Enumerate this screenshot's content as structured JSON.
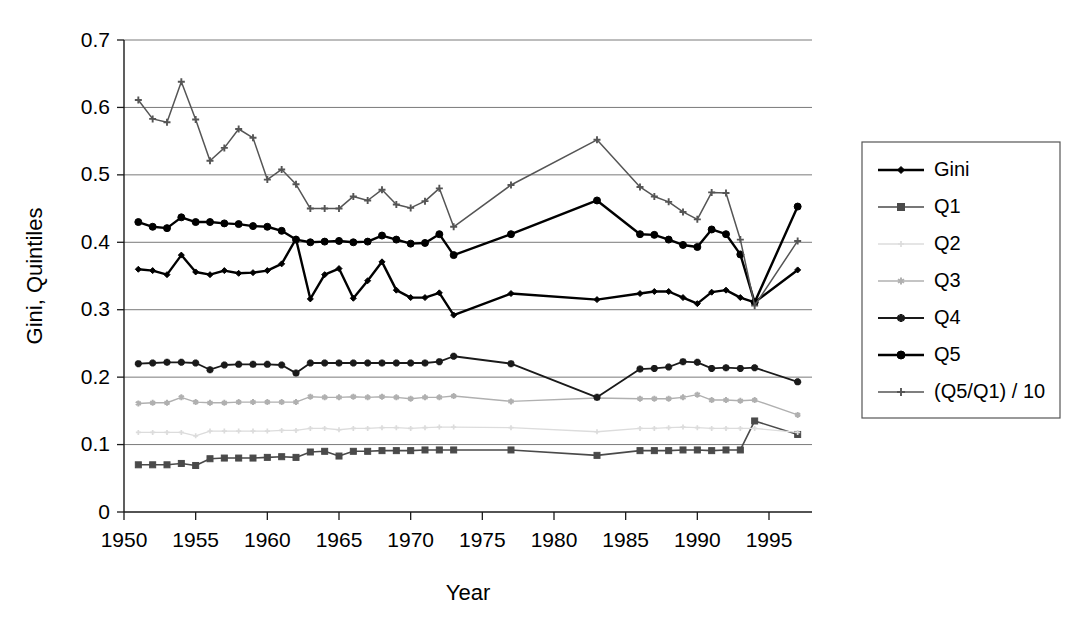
{
  "chart_data": {
    "type": "line",
    "title": "",
    "xlabel": "Year",
    "ylabel": "Gini, Quintiles",
    "xlim": [
      1950,
      1998
    ],
    "ylim": [
      0,
      0.7
    ],
    "grid": true,
    "legend_position": "right",
    "x_ticks": [
      1950,
      1955,
      1960,
      1965,
      1970,
      1975,
      1980,
      1985,
      1990,
      1995
    ],
    "x_tick_labels": [
      "1950",
      "1955",
      "1960",
      "1965",
      "1970",
      "1975",
      "1980",
      "1985",
      "1990",
      "1995"
    ],
    "y_ticks": [
      0,
      0.1,
      0.2,
      0.3,
      0.4,
      0.5,
      0.6,
      0.7
    ],
    "y_tick_labels": [
      "0",
      "0.1",
      "0.2",
      "0.3",
      "0.4",
      "0.5",
      "0.6",
      "0.7"
    ],
    "series": [
      {
        "name": "Gini",
        "marker": "diamond",
        "color": "#000000",
        "line_width": 2.4,
        "marker_size": 6,
        "x": [
          1951,
          1952,
          1953,
          1954,
          1955,
          1956,
          1957,
          1958,
          1959,
          1960,
          1961,
          1962,
          1963,
          1964,
          1965,
          1966,
          1967,
          1968,
          1969,
          1970,
          1971,
          1972,
          1973,
          1977,
          1983,
          1986,
          1987,
          1988,
          1989,
          1990,
          1991,
          1992,
          1993,
          1994,
          1997
        ],
        "y": [
          0.36,
          0.358,
          0.352,
          0.381,
          0.356,
          0.352,
          0.358,
          0.354,
          0.355,
          0.358,
          0.368,
          0.405,
          0.316,
          0.352,
          0.361,
          0.317,
          0.343,
          0.371,
          0.329,
          0.318,
          0.318,
          0.325,
          0.292,
          0.324,
          0.315,
          0.324,
          0.327,
          0.327,
          0.318,
          0.309,
          0.326,
          0.329,
          0.318,
          0.311,
          0.359
        ]
      },
      {
        "name": "Q1",
        "marker": "square",
        "color": "#4a4a4a",
        "line_width": 1.6,
        "marker_size": 6,
        "x": [
          1951,
          1952,
          1953,
          1954,
          1955,
          1956,
          1957,
          1958,
          1959,
          1960,
          1961,
          1962,
          1963,
          1964,
          1965,
          1966,
          1967,
          1968,
          1969,
          1970,
          1971,
          1972,
          1973,
          1977,
          1983,
          1986,
          1987,
          1988,
          1989,
          1990,
          1991,
          1992,
          1993,
          1994,
          1997
        ],
        "y": [
          0.07,
          0.07,
          0.07,
          0.072,
          0.069,
          0.079,
          0.08,
          0.08,
          0.08,
          0.081,
          0.082,
          0.081,
          0.089,
          0.09,
          0.083,
          0.09,
          0.09,
          0.091,
          0.091,
          0.091,
          0.092,
          0.092,
          0.092,
          0.092,
          0.084,
          0.091,
          0.091,
          0.091,
          0.092,
          0.092,
          0.091,
          0.092,
          0.092,
          0.135,
          0.115
        ]
      },
      {
        "name": "Q2",
        "marker": "plus",
        "color": "#dcdcdc",
        "line_width": 1.3,
        "marker_size": 5,
        "x": [
          1951,
          1952,
          1953,
          1954,
          1955,
          1956,
          1957,
          1958,
          1959,
          1960,
          1961,
          1962,
          1963,
          1964,
          1965,
          1966,
          1967,
          1968,
          1969,
          1970,
          1971,
          1972,
          1973,
          1977,
          1983,
          1986,
          1987,
          1988,
          1989,
          1990,
          1991,
          1992,
          1993,
          1994,
          1997
        ],
        "y": [
          0.118,
          0.118,
          0.118,
          0.118,
          0.113,
          0.12,
          0.12,
          0.12,
          0.12,
          0.12,
          0.121,
          0.121,
          0.124,
          0.124,
          0.122,
          0.124,
          0.124,
          0.125,
          0.125,
          0.124,
          0.125,
          0.126,
          0.126,
          0.125,
          0.119,
          0.124,
          0.124,
          0.125,
          0.126,
          0.125,
          0.124,
          0.124,
          0.124,
          0.124,
          0.118
        ]
      },
      {
        "name": "Q3",
        "marker": "star",
        "color": "#b0b0b0",
        "line_width": 1.4,
        "marker_size": 6,
        "x": [
          1951,
          1952,
          1953,
          1954,
          1955,
          1956,
          1957,
          1958,
          1959,
          1960,
          1961,
          1962,
          1963,
          1964,
          1965,
          1966,
          1967,
          1968,
          1969,
          1970,
          1971,
          1972,
          1973,
          1977,
          1983,
          1986,
          1987,
          1988,
          1989,
          1990,
          1991,
          1992,
          1993,
          1994,
          1997
        ],
        "y": [
          0.161,
          0.162,
          0.162,
          0.17,
          0.163,
          0.162,
          0.162,
          0.163,
          0.163,
          0.163,
          0.163,
          0.163,
          0.171,
          0.17,
          0.17,
          0.171,
          0.17,
          0.171,
          0.17,
          0.168,
          0.17,
          0.17,
          0.172,
          0.164,
          0.169,
          0.168,
          0.168,
          0.168,
          0.17,
          0.174,
          0.166,
          0.166,
          0.165,
          0.166,
          0.144
        ]
      },
      {
        "name": "Q4",
        "marker": "asterisk",
        "color": "#1a1a1a",
        "line_width": 1.8,
        "marker_size": 7,
        "x": [
          1951,
          1952,
          1953,
          1954,
          1955,
          1956,
          1957,
          1958,
          1959,
          1960,
          1961,
          1962,
          1963,
          1964,
          1965,
          1966,
          1967,
          1968,
          1969,
          1970,
          1971,
          1972,
          1973,
          1977,
          1983,
          1986,
          1987,
          1988,
          1989,
          1990,
          1991,
          1992,
          1993,
          1994,
          1997
        ],
        "y": [
          0.22,
          0.221,
          0.222,
          0.222,
          0.221,
          0.211,
          0.218,
          0.219,
          0.219,
          0.219,
          0.218,
          0.206,
          0.221,
          0.221,
          0.221,
          0.221,
          0.221,
          0.221,
          0.221,
          0.221,
          0.221,
          0.223,
          0.231,
          0.22,
          0.17,
          0.212,
          0.213,
          0.215,
          0.223,
          0.222,
          0.213,
          0.214,
          0.213,
          0.214,
          0.193
        ]
      },
      {
        "name": "Q5",
        "marker": "circle",
        "color": "#000000",
        "line_width": 2.4,
        "marker_size": 7,
        "x": [
          1951,
          1952,
          1953,
          1954,
          1955,
          1956,
          1957,
          1958,
          1959,
          1960,
          1961,
          1962,
          1963,
          1964,
          1965,
          1966,
          1967,
          1968,
          1969,
          1970,
          1971,
          1972,
          1973,
          1977,
          1983,
          1986,
          1987,
          1988,
          1989,
          1990,
          1991,
          1992,
          1993,
          1994,
          1997
        ],
        "y": [
          0.43,
          0.423,
          0.421,
          0.437,
          0.43,
          0.43,
          0.428,
          0.427,
          0.424,
          0.423,
          0.417,
          0.404,
          0.4,
          0.401,
          0.402,
          0.4,
          0.401,
          0.41,
          0.404,
          0.398,
          0.399,
          0.412,
          0.381,
          0.412,
          0.462,
          0.412,
          0.411,
          0.404,
          0.396,
          0.393,
          0.419,
          0.412,
          0.382,
          0.311,
          0.453
        ]
      },
      {
        "name": "(Q5/Q1) / 10",
        "marker": "plus",
        "color": "#555555",
        "line_width": 1.5,
        "marker_size": 7,
        "x": [
          1951,
          1952,
          1953,
          1954,
          1955,
          1956,
          1957,
          1958,
          1959,
          1960,
          1961,
          1962,
          1963,
          1964,
          1965,
          1966,
          1967,
          1968,
          1969,
          1970,
          1971,
          1972,
          1973,
          1977,
          1983,
          1986,
          1987,
          1988,
          1989,
          1990,
          1991,
          1992,
          1993,
          1994,
          1997
        ],
        "y": [
          0.611,
          0.583,
          0.578,
          0.638,
          0.582,
          0.521,
          0.54,
          0.568,
          0.555,
          0.493,
          0.508,
          0.486,
          0.45,
          0.45,
          0.45,
          0.468,
          0.462,
          0.478,
          0.456,
          0.451,
          0.461,
          0.48,
          0.423,
          0.485,
          0.552,
          0.482,
          0.468,
          0.46,
          0.445,
          0.434,
          0.474,
          0.473,
          0.404,
          0.306,
          0.402
        ]
      }
    ]
  },
  "legend": {
    "items": [
      {
        "label": "Gini"
      },
      {
        "label": "Q1"
      },
      {
        "label": "Q2"
      },
      {
        "label": "Q3"
      },
      {
        "label": "Q4"
      },
      {
        "label": "Q5"
      },
      {
        "label": "(Q5/Q1) / 10"
      }
    ]
  }
}
